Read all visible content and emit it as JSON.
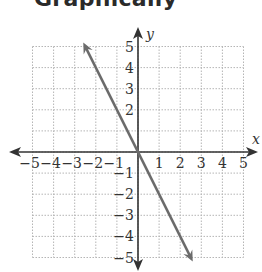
{
  "header": {
    "title": "Graphically"
  },
  "chart_data": {
    "type": "line",
    "title": "Graphically",
    "xlabel": "x",
    "ylabel": "y",
    "xlim": [
      -5,
      5
    ],
    "ylim": [
      -5,
      5
    ],
    "grid": true,
    "x_ticks": [
      "-5",
      "-4",
      "-3",
      "-2",
      "-1",
      "1",
      "2",
      "3",
      "4",
      "5"
    ],
    "y_ticks": [
      "5",
      "4",
      "3",
      "2",
      "-1",
      "-2",
      "-3",
      "-4",
      "-5"
    ],
    "series": [
      {
        "name": "y = -2x",
        "x": [
          -2.5,
          0,
          2.5
        ],
        "y": [
          5,
          0,
          -5
        ],
        "color": "#6b6b6b",
        "arrows": "both"
      }
    ],
    "colors": {
      "axis": "#333333",
      "grid": "#b5b5b5",
      "line": "#6b6b6b"
    }
  }
}
